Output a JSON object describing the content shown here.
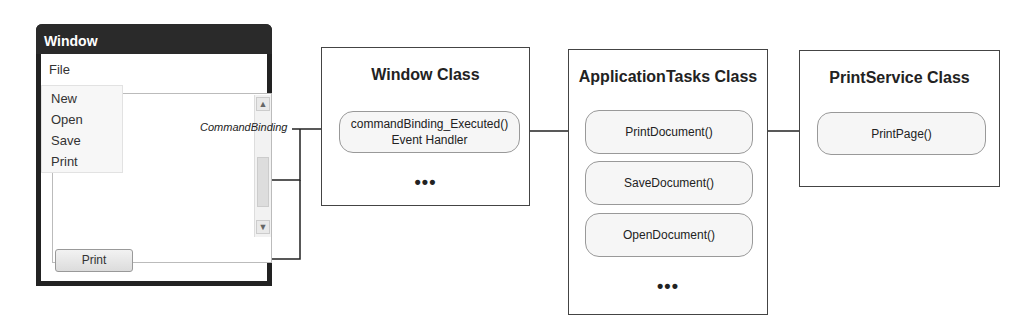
{
  "window_mock": {
    "title": "Window",
    "menu": "File",
    "menu_items": [
      "New",
      "Open",
      "Save",
      "Print"
    ],
    "button_label": "Print"
  },
  "connector_label": "CommandBinding",
  "classes": [
    {
      "title": "Window Class",
      "methods": [
        "commandBinding_Executed()",
        "Event Handler"
      ],
      "more": "•••"
    },
    {
      "title": "ApplicationTasks Class",
      "methods": [
        "PrintDocument()",
        "SaveDocument()",
        "OpenDocument()"
      ],
      "more": "•••"
    },
    {
      "title": "PrintService Class",
      "methods": [
        "PrintPage()"
      ]
    }
  ]
}
